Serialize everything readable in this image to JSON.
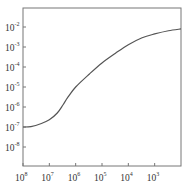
{
  "chart_data": {
    "type": "line",
    "title": "",
    "xlabel": "",
    "ylabel": "",
    "xscale": "log",
    "yscale": "log",
    "x_reversed": true,
    "xlim": [
      100000000,
      100
    ],
    "ylim": [
      1e-09,
      0.01
    ],
    "grid": false,
    "legend": null,
    "x_ticks": [
      {
        "base": "10",
        "exp": "8",
        "value": 100000000
      },
      {
        "base": "10",
        "exp": "7",
        "value": 10000000
      },
      {
        "base": "10",
        "exp": "6",
        "value": 1000000
      },
      {
        "base": "10",
        "exp": "5",
        "value": 100000
      },
      {
        "base": "10",
        "exp": "4",
        "value": 10000
      },
      {
        "base": "10",
        "exp": "3",
        "value": 1000
      }
    ],
    "y_ticks": [
      {
        "base": "10",
        "exp": "-2",
        "value": 0.01
      },
      {
        "base": "10",
        "exp": "-3",
        "value": 0.001
      },
      {
        "base": "10",
        "exp": "-4",
        "value": 0.0001
      },
      {
        "base": "10",
        "exp": "-5",
        "value": 1e-05
      },
      {
        "base": "10",
        "exp": "-6",
        "value": 1e-06
      },
      {
        "base": "10",
        "exp": "-7",
        "value": 1e-07
      },
      {
        "base": "10",
        "exp": "-8",
        "value": 1e-08
      }
    ],
    "series": [
      {
        "name": "curve",
        "color": "#555555",
        "x": [
          100000000,
          50000000,
          20000000,
          10000000,
          5000000,
          3000000,
          2000000,
          1000000,
          300000,
          100000,
          30000,
          10000,
          3000,
          1000,
          300,
          100
        ],
        "y": [
          1e-07,
          1.05e-07,
          1.5e-07,
          2.3e-07,
          5e-07,
          1.3e-06,
          3e-06,
          1e-05,
          4.5e-05,
          0.00016,
          0.0005,
          0.0013,
          0.0029,
          0.0045,
          0.0065,
          0.008
        ]
      }
    ]
  }
}
